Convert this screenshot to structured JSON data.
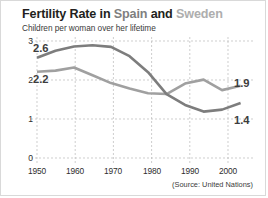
{
  "title": {
    "part1": "Fertility Rate in",
    "spain": "Spain",
    "conjunction": "and",
    "sweden": "Sweden"
  },
  "subtitle": "Children per woman over her lifetime",
  "source": "(Source: United Nations)",
  "colors": {
    "spain_line": "#7d7d7d",
    "sweden_line": "#a0a0a0",
    "title_dark": "#231f20",
    "grid": "#b9b9b9",
    "card_border": "#d9d9d9",
    "background": "#ffffff"
  },
  "callouts": {
    "spain_start": "2.6",
    "sweden_start": "2.2",
    "sweden_end": "1.9",
    "spain_end": "1.4"
  },
  "chart_data": {
    "type": "line",
    "title": "Fertility Rate in Spain and Sweden",
    "subtitle": "Children per woman over her lifetime",
    "xlabel": "",
    "ylabel": "Children per woman over her lifetime",
    "xlim": [
      1950,
      2007
    ],
    "ylim": [
      0,
      3
    ],
    "yticks": [
      0,
      1,
      2,
      3
    ],
    "ytick_labels": [
      "0",
      "1",
      "2",
      "3"
    ],
    "xticks": [
      1950,
      1960,
      1970,
      1980,
      1990,
      2000
    ],
    "xtick_labels": [
      "1950",
      "1960",
      "1970",
      "1980",
      "1990",
      "2000"
    ],
    "grid": true,
    "grid_style": "dashed",
    "legend": "in-title",
    "annotations": [
      {
        "text": "2.6",
        "series": "Spain",
        "x": 1950,
        "y": 2.6,
        "position": "left"
      },
      {
        "text": "2.2",
        "series": "Sweden",
        "x": 1950,
        "y": 2.2,
        "position": "left"
      },
      {
        "text": "1.9",
        "series": "Sweden",
        "x": 2005,
        "y": 1.9,
        "position": "right"
      },
      {
        "text": "1.4",
        "series": "Spain",
        "x": 2005,
        "y": 1.4,
        "position": "right"
      }
    ],
    "x": [
      1950,
      1955,
      1960,
      1965,
      1970,
      1975,
      1980,
      1985,
      1990,
      1995,
      2000,
      2005
    ],
    "series": [
      {
        "name": "Spain",
        "color": "#7d7d7d",
        "values": [
          2.57,
          2.75,
          2.86,
          2.89,
          2.85,
          2.61,
          2.2,
          1.64,
          1.36,
          1.19,
          1.24,
          1.41
        ]
      },
      {
        "name": "Sweden",
        "color": "#a0a0a0",
        "values": [
          2.21,
          2.24,
          2.32,
          2.12,
          1.92,
          1.78,
          1.66,
          1.64,
          1.91,
          2.01,
          1.74,
          1.85
        ]
      }
    ]
  },
  "axis_geometry": {
    "plot_left": 36,
    "plot_right": 247,
    "plot_top": 40,
    "plot_bottom": 157
  }
}
